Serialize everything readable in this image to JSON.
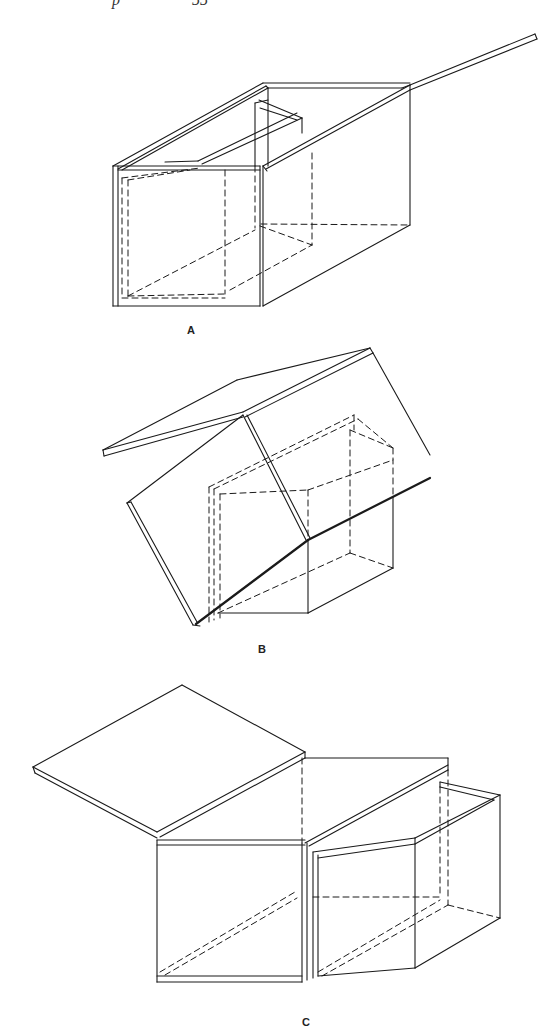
{
  "page": {
    "background": "#ffffff",
    "ink": "#1a1a1a",
    "running_header": {
      "left_fragment": "",
      "page_fragment": "55",
      "note": ""
    }
  },
  "figures": [
    {
      "id": "A",
      "label": "A",
      "label_pos": [
        187,
        334
      ],
      "solid": [
        [
          [
            113,
            166
          ],
          [
            113,
            306
          ]
        ],
        [
          [
            118,
            166
          ],
          [
            118,
            306
          ]
        ],
        [
          [
            113,
            306
          ],
          [
            260,
            306
          ]
        ],
        [
          [
            113,
            166
          ],
          [
            260,
            166
          ]
        ],
        [
          [
            118,
            170
          ],
          [
            260,
            170
          ]
        ],
        [
          [
            260,
            166
          ],
          [
            260,
            306
          ]
        ],
        [
          [
            263,
            166
          ],
          [
            263,
            306
          ]
        ],
        [
          [
            263,
            306
          ],
          [
            410,
            225
          ]
        ],
        [
          [
            410,
            85
          ],
          [
            410,
            225
          ]
        ],
        [
          [
            113,
            166
          ],
          [
            263,
            83
          ]
        ],
        [
          [
            118,
            169
          ],
          [
            266,
            86
          ]
        ],
        [
          [
            122,
            170
          ],
          [
            268,
            88
          ]
        ],
        [
          [
            263,
            83
          ],
          [
            410,
            83
          ]
        ],
        [
          [
            268,
            88
          ],
          [
            402,
            88
          ]
        ],
        [
          [
            402,
            88
          ],
          [
            410,
            85
          ]
        ],
        [
          [
            266,
            86
          ],
          [
            268,
            88
          ]
        ],
        [
          [
            268,
            88
          ],
          [
            268,
            166
          ]
        ],
        [
          [
            255,
            103
          ],
          [
            255,
            166
          ]
        ],
        [
          [
            255,
            103
          ],
          [
            268,
            100
          ]
        ],
        [
          [
            259,
            100
          ],
          [
            302,
            118
          ]
        ],
        [
          [
            302,
            118
          ],
          [
            302,
            133
          ]
        ],
        [
          [
            260,
            108
          ],
          [
            297,
            120
          ]
        ],
        [
          [
            202,
            164
          ],
          [
            302,
            118
          ]
        ],
        [
          [
            198,
            161
          ],
          [
            297,
            113
          ]
        ],
        [
          [
            165,
            162
          ],
          [
            198,
            161
          ]
        ],
        [
          [
            263,
            166
          ],
          [
            410,
            85
          ]
        ],
        [
          [
            266,
            169
          ],
          [
            410,
            90
          ]
        ],
        [
          [
            410,
            85
          ],
          [
            535,
            34
          ]
        ],
        [
          [
            410,
            90
          ],
          [
            537,
            39
          ]
        ],
        [
          [
            535,
            34
          ],
          [
            537,
            39
          ]
        ],
        [
          [
            263,
            166
          ],
          [
            267,
            171
          ]
        ]
      ],
      "dashed": [
        [
          [
            122,
            178
          ],
          [
            122,
            298
          ]
        ],
        [
          [
            128,
            180
          ],
          [
            128,
            296
          ]
        ],
        [
          [
            128,
            180
          ],
          [
            190,
            170
          ]
        ],
        [
          [
            122,
            178
          ],
          [
            200,
            168
          ]
        ],
        [
          [
            128,
            296
          ],
          [
            225,
            294
          ]
        ],
        [
          [
            122,
            298
          ],
          [
            225,
            298
          ]
        ],
        [
          [
            225,
            170
          ],
          [
            225,
            294
          ]
        ],
        [
          [
            255,
            166
          ],
          [
            255,
            228
          ]
        ],
        [
          [
            261,
            224
          ],
          [
            410,
            225
          ]
        ],
        [
          [
            312,
            153
          ],
          [
            312,
            245
          ]
        ],
        [
          [
            128,
            296
          ],
          [
            255,
            230
          ]
        ],
        [
          [
            260,
            226
          ],
          [
            312,
            245
          ]
        ],
        [
          [
            230,
            290
          ],
          [
            312,
            245
          ]
        ]
      ]
    },
    {
      "id": "B",
      "label": "B",
      "label_pos": [
        258,
        653
      ],
      "solid": [
        [
          [
            103,
            450
          ],
          [
            237,
            380
          ]
        ],
        [
          [
            237,
            380
          ],
          [
            370,
            348
          ]
        ],
        [
          [
            103,
            450
          ],
          [
            104,
            456
          ]
        ],
        [
          [
            104,
            456
          ],
          [
            243,
            417
          ]
        ],
        [
          [
            103,
            450
          ],
          [
            243,
            412
          ]
        ],
        [
          [
            243,
            412
          ],
          [
            370,
            348
          ]
        ],
        [
          [
            245,
            417
          ],
          [
            373,
            353
          ]
        ],
        [
          [
            370,
            348
          ],
          [
            373,
            353
          ]
        ],
        [
          [
            373,
            353
          ],
          [
            430,
            455
          ]
        ],
        [
          [
            243,
            415
          ],
          [
            127,
            503
          ]
        ],
        [
          [
            127,
            503
          ],
          [
            193,
            625
          ]
        ],
        [
          [
            131,
            502
          ],
          [
            197,
            622
          ]
        ],
        [
          [
            127,
            503
          ],
          [
            131,
            502
          ]
        ],
        [
          [
            243,
            415
          ],
          [
            306,
            540
          ]
        ],
        [
          [
            247,
            415
          ],
          [
            310,
            538
          ]
        ],
        [
          [
            193,
            625
          ],
          [
            200,
            626
          ]
        ],
        [
          [
            218,
            613
          ],
          [
            308,
            613
          ]
        ],
        [
          [
            308,
            540
          ],
          [
            308,
            613
          ]
        ],
        [
          [
            308,
            613
          ],
          [
            393,
            568
          ]
        ],
        [
          [
            393,
            497
          ],
          [
            393,
            568
          ]
        ]
      ],
      "thick": [
        [
          [
            196,
            624
          ],
          [
            308,
            540
          ]
        ],
        [
          [
            308,
            540
          ],
          [
            430,
            478
          ]
        ]
      ],
      "dashed": [
        [
          [
            209,
            487
          ],
          [
            209,
            622
          ]
        ],
        [
          [
            214,
            489
          ],
          [
            214,
            620
          ]
        ],
        [
          [
            220,
            494
          ],
          [
            220,
            618
          ]
        ],
        [
          [
            209,
            487
          ],
          [
            354,
            415
          ]
        ],
        [
          [
            214,
            489
          ],
          [
            358,
            419
          ]
        ],
        [
          [
            220,
            494
          ],
          [
            308,
            490
          ]
        ],
        [
          [
            308,
            490
          ],
          [
            308,
            540
          ]
        ],
        [
          [
            354,
            415
          ],
          [
            354,
            430
          ]
        ],
        [
          [
            358,
            419
          ],
          [
            393,
            448
          ]
        ],
        [
          [
            350,
            430
          ],
          [
            393,
            448
          ]
        ],
        [
          [
            350,
            430
          ],
          [
            350,
            553
          ]
        ],
        [
          [
            350,
            553
          ],
          [
            393,
            568
          ]
        ],
        [
          [
            218,
            613
          ],
          [
            350,
            553
          ]
        ],
        [
          [
            308,
            490
          ],
          [
            393,
            460
          ]
        ],
        [
          [
            393,
            448
          ],
          [
            393,
            497
          ]
        ]
      ]
    },
    {
      "id": "C",
      "label": "C",
      "label_pos": [
        302,
        1026
      ],
      "solid": [
        [
          [
            33,
            767
          ],
          [
            182,
            685
          ]
        ],
        [
          [
            182,
            685
          ],
          [
            305,
            752
          ]
        ],
        [
          [
            33,
            767
          ],
          [
            35,
            773
          ]
        ],
        [
          [
            35,
            773
          ],
          [
            157,
            838
          ]
        ],
        [
          [
            33,
            767
          ],
          [
            157,
            832
          ]
        ],
        [
          [
            157,
            832
          ],
          [
            305,
            752
          ]
        ],
        [
          [
            160,
            837
          ],
          [
            305,
            758
          ]
        ],
        [
          [
            305,
            752
          ],
          [
            305,
            758
          ]
        ],
        [
          [
            157,
            840
          ],
          [
            305,
            840
          ]
        ],
        [
          [
            157,
            845
          ],
          [
            305,
            845
          ]
        ],
        [
          [
            157,
            840
          ],
          [
            157,
            982
          ]
        ],
        [
          [
            157,
            976
          ],
          [
            302,
            976
          ]
        ],
        [
          [
            157,
            982
          ],
          [
            302,
            982
          ]
        ],
        [
          [
            302,
            843
          ],
          [
            302,
            982
          ]
        ],
        [
          [
            307,
            843
          ],
          [
            307,
            980
          ]
        ],
        [
          [
            305,
            758
          ],
          [
            448,
            758
          ]
        ],
        [
          [
            305,
            843
          ],
          [
            448,
            765
          ]
        ],
        [
          [
            309,
            846
          ],
          [
            448,
            770
          ]
        ],
        [
          [
            448,
            758
          ],
          [
            448,
            770
          ]
        ],
        [
          [
            313,
            852
          ],
          [
            313,
            978
          ]
        ],
        [
          [
            318,
            855
          ],
          [
            318,
            976
          ]
        ],
        [
          [
            313,
            852
          ],
          [
            415,
            838
          ]
        ],
        [
          [
            318,
            858
          ],
          [
            415,
            844
          ]
        ],
        [
          [
            415,
            838
          ],
          [
            500,
            795
          ]
        ],
        [
          [
            415,
            844
          ],
          [
            494,
            800
          ]
        ],
        [
          [
            440,
            782
          ],
          [
            500,
            795
          ]
        ],
        [
          [
            440,
            787
          ],
          [
            494,
            800
          ]
        ],
        [
          [
            440,
            782
          ],
          [
            440,
            787
          ]
        ],
        [
          [
            500,
            795
          ],
          [
            500,
            918
          ]
        ],
        [
          [
            415,
            838
          ],
          [
            415,
            968
          ]
        ],
        [
          [
            318,
            976
          ],
          [
            415,
            968
          ]
        ],
        [
          [
            415,
            968
          ],
          [
            500,
            918
          ]
        ]
      ],
      "dashed": [
        [
          [
            302,
            758
          ],
          [
            302,
            843
          ]
        ],
        [
          [
            313,
            897
          ],
          [
            440,
            897
          ]
        ],
        [
          [
            440,
            787
          ],
          [
            440,
            897
          ]
        ],
        [
          [
            448,
            770
          ],
          [
            448,
            905
          ]
        ],
        [
          [
            448,
            905
          ],
          [
            500,
            918
          ]
        ],
        [
          [
            160,
            972
          ],
          [
            295,
            892
          ]
        ],
        [
          [
            165,
            975
          ],
          [
            297,
            898
          ]
        ],
        [
          [
            318,
            972
          ],
          [
            440,
            900
          ]
        ],
        [
          [
            322,
            976
          ],
          [
            448,
            905
          ]
        ]
      ]
    }
  ]
}
